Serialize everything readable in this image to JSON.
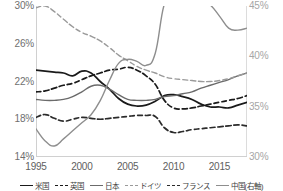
{
  "chart_data": {
    "type": "line",
    "title": "",
    "subtitle": "",
    "xlabel": "",
    "ylabel": "",
    "y2label": "",
    "grid": false,
    "legend_position": "bottom",
    "xlim": [
      1995,
      2018
    ],
    "ylim": [
      14,
      30
    ],
    "y2lim": [
      30,
      45
    ],
    "yticks": [
      "14%",
      "18%",
      "22%",
      "26%",
      "30%"
    ],
    "ytick_values": [
      14,
      18,
      22,
      26,
      30
    ],
    "y2ticks": [
      "30%",
      "35%",
      "40%",
      "45%"
    ],
    "y2tick_values": [
      30,
      35,
      40,
      45
    ],
    "xticks": [
      "1995",
      "2000",
      "2005",
      "2010",
      "2015"
    ],
    "xtick_values": [
      1995,
      2000,
      2005,
      2010,
      2015
    ],
    "x": [
      1995,
      1996,
      1997,
      1998,
      1999,
      2000,
      2001,
      2002,
      2003,
      2004,
      2005,
      2006,
      2007,
      2008,
      2009,
      2010,
      2011,
      2012,
      2013,
      2014,
      2015,
      2016,
      2017,
      2018
    ],
    "series": [
      {
        "name": "米国",
        "legend_label": "米国",
        "color": "#1a1a1a",
        "style": "solid",
        "axis": "left",
        "values": [
          23.2,
          23.1,
          23.0,
          22.9,
          22.6,
          23.1,
          22.9,
          22.0,
          21.2,
          20.2,
          19.6,
          19.4,
          19.5,
          19.9,
          20.5,
          20.6,
          20.4,
          20.1,
          19.6,
          19.3,
          19.3,
          19.2,
          19.5,
          19.8
        ]
      },
      {
        "name": "英国",
        "legend_label": "英国",
        "color": "#1a1a1a",
        "style": "dashed",
        "axis": "left",
        "values": [
          20.9,
          21.0,
          21.3,
          21.6,
          21.8,
          22.2,
          22.6,
          22.9,
          23.2,
          23.3,
          23.5,
          23.2,
          22.6,
          21.7,
          20.0,
          19.2,
          19.1,
          19.2,
          19.4,
          19.6,
          19.8,
          20.0,
          20.2,
          20.5
        ]
      },
      {
        "name": "日本",
        "legend_label": "日本",
        "color": "#6b6b6b",
        "style": "solid",
        "axis": "left",
        "values": [
          20.1,
          20.0,
          20.0,
          20.1,
          20.4,
          20.9,
          21.5,
          21.6,
          21.2,
          20.6,
          20.1,
          20.0,
          20.0,
          20.1,
          20.4,
          20.5,
          20.7,
          20.9,
          21.3,
          21.6,
          21.9,
          22.2,
          22.6,
          22.9
        ]
      },
      {
        "name": "ドイツ",
        "legend_label": "ドイツ",
        "color": "#9a9a9a",
        "style": "dashed",
        "axis": "left",
        "values": [
          29.8,
          30.0,
          29.4,
          28.6,
          27.8,
          27.2,
          26.8,
          26.3,
          25.6,
          24.8,
          24.2,
          23.6,
          23.2,
          22.9,
          22.5,
          22.3,
          22.2,
          22.1,
          22.0,
          22.0,
          22.1,
          22.3,
          22.6,
          22.9
        ]
      },
      {
        "name": "フランス",
        "legend_label": "フランス",
        "color": "#2b2b2b",
        "style": "dashed",
        "axis": "left",
        "values": [
          18.2,
          18.5,
          18.1,
          17.8,
          18.0,
          18.2,
          18.1,
          18.0,
          18.1,
          18.2,
          18.3,
          18.4,
          18.4,
          18.3,
          17.1,
          16.6,
          16.7,
          16.9,
          17.0,
          17.1,
          17.2,
          17.3,
          17.4,
          17.3
        ]
      },
      {
        "name": "中国(右軸)",
        "legend_label": "中国(右軸)",
        "color": "#8e8e8e",
        "style": "solid",
        "axis": "right",
        "values": [
          32.8,
          31.6,
          31.1,
          31.8,
          32.6,
          33.4,
          34.2,
          35.6,
          37.6,
          39.3,
          39.7,
          39.5,
          39.1,
          40.3,
          45.2,
          45.5,
          45.4,
          45.5,
          45.6,
          45.1,
          44.0,
          42.8,
          42.6,
          42.8
        ]
      }
    ]
  }
}
